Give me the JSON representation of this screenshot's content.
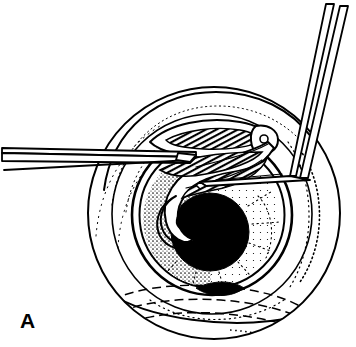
{
  "figure": {
    "panel_label": "A",
    "width": 356,
    "height": 347,
    "background_color": "#ffffff",
    "ink_color": "#000000"
  },
  "anatomy": {
    "outer_globe": {
      "name": "eyeball-outline",
      "center_x": 214,
      "center_y": 213,
      "radius": 126,
      "stroke_width": 2
    },
    "sclera_ring": {
      "name": "sclera-ring",
      "center_x": 212,
      "center_y": 214,
      "radius": 100,
      "stroke_width": 1.6
    },
    "limbus": {
      "name": "limbus-outline",
      "center_x": 212,
      "center_y": 215,
      "radius": 80,
      "stroke_width": 2.6
    },
    "cornea": {
      "name": "cornea-outline",
      "center_x": 212,
      "center_y": 215,
      "radius": 72,
      "stroke_width": 2
    },
    "iris": {
      "name": "iris-stippled-ring",
      "center_x": 211,
      "center_y": 219,
      "outer_radius": 68,
      "inner_radius": 40,
      "texture": "radial-stipple"
    },
    "pupil": {
      "name": "pupil",
      "center_x": 210,
      "center_y": 232,
      "radius": 39,
      "fill": "#000000"
    }
  },
  "instruments": {
    "forceps": {
      "name": "forceps",
      "entry_side": "left",
      "tip_x": 188,
      "tip_y": 159,
      "jaw_count": 2,
      "stroke_width": 1.8
    },
    "hook": {
      "name": "bent-hook-instrument",
      "entry_side": "top-right",
      "bend_x": 300,
      "bend_y": 176,
      "tip_x": 198,
      "tip_y": 186,
      "stroke_width": 1.8
    }
  },
  "tissue": {
    "flap": {
      "name": "rolled-tissue-flap",
      "description": "Capsular flap rolled and lifted from the pupil margin toward the upper right.",
      "texture": "hatched"
    },
    "hidden_structures": {
      "name": "hidden-structure-dashed-outline",
      "description": "Dashed contours at the lower globe indicating structures beneath the surface.",
      "line_style": "dashed"
    }
  }
}
